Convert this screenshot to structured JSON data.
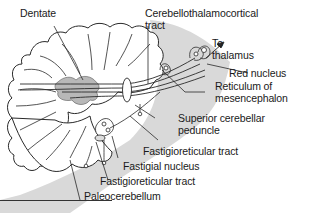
{
  "diagram": {
    "type": "anatomical illustration",
    "colors": {
      "brainstem_fill": "#d9d9d9",
      "cerebellum_fill": "#ffffff",
      "nuclei_fill": "#b8b8b8",
      "line": "#2a2a2a",
      "text": "#1a1a1a"
    },
    "labels": {
      "dentate": "Dentate",
      "cerebellothalamocortical_1": "Cerebellothalamocortical",
      "cerebellothalamocortical_2": "tract",
      "to_thalamus_1": "To",
      "to_thalamus_2": "thalamus",
      "red_nucleus": "Red nucleus",
      "reticulum_1": "Reticulum of",
      "reticulum_2": "mesencephalon",
      "superior_peduncle_1": "Superior cerebellar",
      "superior_peduncle_2": "peduncle",
      "fastigioreticular_tract_upper": "Fastigioreticular tract",
      "fastigial_nucleus": "Fastigial nucleus",
      "fastigioreticular_tract_lower": "Fastigioreticular tract",
      "paleocerebellum": "Paleocerebellum"
    }
  }
}
